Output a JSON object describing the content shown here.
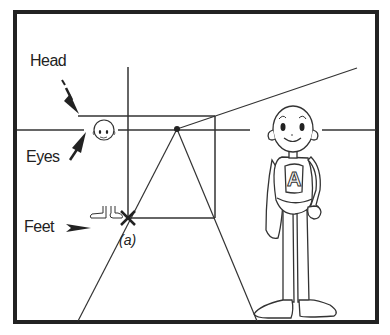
{
  "figure": {
    "labels": {
      "head": "Head",
      "eyes": "Eyes",
      "feet": "Feet"
    },
    "caption": "(a)",
    "character_badge_letter": "A",
    "colors": {
      "ink": "#222222",
      "background": "#ffffff"
    }
  }
}
